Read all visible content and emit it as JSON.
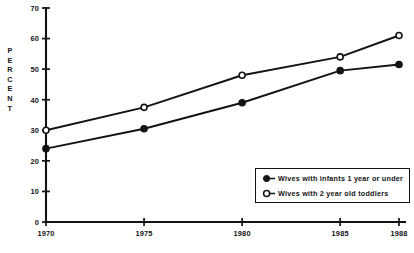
{
  "chart_data": {
    "type": "line",
    "title": "",
    "xlabel": "",
    "ylabel": "PERCENT",
    "x": [
      1970,
      1975,
      1980,
      1985,
      1988
    ],
    "categories": [
      "1970",
      "1975",
      "1980",
      "1985",
      "1988"
    ],
    "xtick_labels": [
      "1970",
      "1975",
      "1980",
      "1985",
      "1988"
    ],
    "ytick_labels": [
      "0",
      "10",
      "20",
      "30",
      "40",
      "50",
      "60",
      "70"
    ],
    "yticks": [
      0,
      10,
      20,
      30,
      40,
      50,
      60,
      70
    ],
    "ylim": [
      0,
      70
    ],
    "xlim": [
      1970,
      1988
    ],
    "grid": false,
    "legend_position": "inside-lower-right",
    "series": [
      {
        "name": "Wives with infants 1 year or under",
        "marker": "filled-circle",
        "values": [
          24,
          30.5,
          39,
          49.5,
          51.5
        ]
      },
      {
        "name": "Wives with 2 year old toddlers",
        "marker": "open-circle",
        "values": [
          30,
          37.5,
          48,
          54,
          61
        ]
      }
    ]
  },
  "axis": {
    "y_title_letters": [
      "P",
      "E",
      "R",
      "C",
      "E",
      "N",
      "T"
    ]
  },
  "legend": {
    "items": [
      {
        "label": "Wives with infants 1 year or under",
        "marker": "filled-circle"
      },
      {
        "label": "Wives with 2 year old toddlers",
        "marker": "open-circle"
      }
    ]
  },
  "colors": {
    "ink": "#131313",
    "background": "#ffffff"
  }
}
